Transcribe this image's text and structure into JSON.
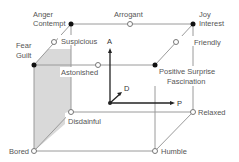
{
  "diagram": {
    "type": "PAD emotion cube",
    "colors": {
      "edge": "#9a9a9a",
      "axis": "#222222",
      "shade": "#d9d9d9",
      "label": "#555555"
    },
    "axes": {
      "A": "A",
      "P": "P",
      "D": "D"
    },
    "vertices": [
      {
        "id": "anger",
        "label_lines": [
          "Anger",
          "Contempt"
        ],
        "filled": true
      },
      {
        "id": "arrogant",
        "label_lines": [
          "Arrogant"
        ],
        "filled": false
      },
      {
        "id": "joy",
        "label_lines": [
          "Joy",
          "Interest"
        ],
        "filled": true
      },
      {
        "id": "suspicious",
        "label_lines": [
          "Suspicious"
        ],
        "filled": false
      },
      {
        "id": "friendly",
        "label_lines": [
          "Friendly"
        ],
        "filled": false
      },
      {
        "id": "fear",
        "label_lines": [
          "Fear",
          "Guilt"
        ],
        "filled": true
      },
      {
        "id": "astonished",
        "label_lines": [
          "Astonished"
        ],
        "filled": false
      },
      {
        "id": "positive-surprise",
        "label_lines": [
          "Positive Surprise",
          "Fascination"
        ],
        "filled": true
      },
      {
        "id": "disdainful",
        "label_lines": [
          "Disdainful"
        ],
        "filled": false
      },
      {
        "id": "relaxed",
        "label_lines": [
          "Relaxed"
        ],
        "filled": false
      },
      {
        "id": "bored",
        "label_lines": [
          "Bored"
        ],
        "filled": false
      },
      {
        "id": "humble",
        "label_lines": [
          "Humble"
        ],
        "filled": false
      }
    ]
  }
}
